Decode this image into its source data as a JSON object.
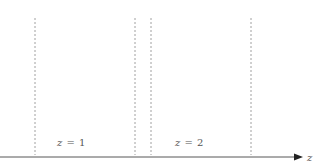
{
  "diagram": {
    "axis": {
      "label": "z",
      "y": 157,
      "x_start": 0,
      "x_end": 302
    },
    "dashed_lines": [
      {
        "x": 35
      },
      {
        "x": 135
      },
      {
        "x": 151
      },
      {
        "x": 251
      }
    ],
    "regions": [
      {
        "var": "z",
        "eq": "=",
        "value": "1",
        "x": 57
      },
      {
        "var": "z",
        "eq": "=",
        "value": "2",
        "x": 175
      }
    ],
    "colors": {
      "axis": "#444444",
      "dash": "#888888",
      "text": "#555555"
    }
  }
}
